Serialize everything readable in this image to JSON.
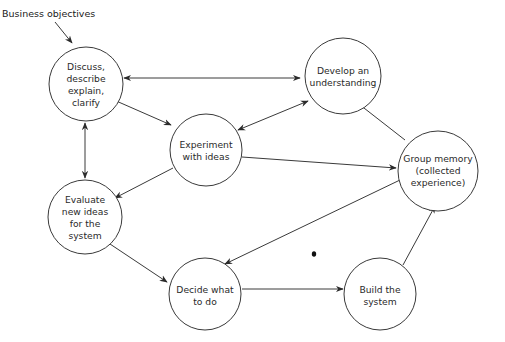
{
  "diagram": {
    "input_label": "Business objectives",
    "nodes": [
      {
        "id": "discuss",
        "lines": [
          "Discuss,",
          "describe",
          "explain,",
          "clarify"
        ]
      },
      {
        "id": "develop",
        "lines": [
          "Develop an",
          "understanding"
        ]
      },
      {
        "id": "experiment",
        "lines": [
          "Experiment",
          "with ideas"
        ]
      },
      {
        "id": "group_memory",
        "lines": [
          "Group memory",
          "(collected",
          "experience)"
        ]
      },
      {
        "id": "evaluate",
        "lines": [
          "Evaluate",
          "new ideas",
          "for the",
          "system"
        ]
      },
      {
        "id": "decide",
        "lines": [
          "Decide what",
          "to do"
        ]
      },
      {
        "id": "build",
        "lines": [
          "Build the",
          "system"
        ]
      }
    ],
    "edges": [
      {
        "from": "business_objectives",
        "to": "discuss",
        "direction": "forward"
      },
      {
        "from": "discuss",
        "to": "develop",
        "direction": "both"
      },
      {
        "from": "discuss",
        "to": "experiment",
        "direction": "forward"
      },
      {
        "from": "discuss",
        "to": "evaluate",
        "direction": "both"
      },
      {
        "from": "experiment",
        "to": "develop",
        "direction": "both"
      },
      {
        "from": "experiment",
        "to": "group_memory",
        "direction": "forward"
      },
      {
        "from": "experiment",
        "to": "evaluate",
        "direction": "forward"
      },
      {
        "from": "group_memory",
        "to": "develop",
        "direction": "forward"
      },
      {
        "from": "group_memory",
        "to": "decide",
        "direction": "forward"
      },
      {
        "from": "evaluate",
        "to": "decide",
        "direction": "forward"
      },
      {
        "from": "decide",
        "to": "build",
        "direction": "forward"
      },
      {
        "from": "build",
        "to": "group_memory",
        "direction": "forward"
      }
    ]
  }
}
